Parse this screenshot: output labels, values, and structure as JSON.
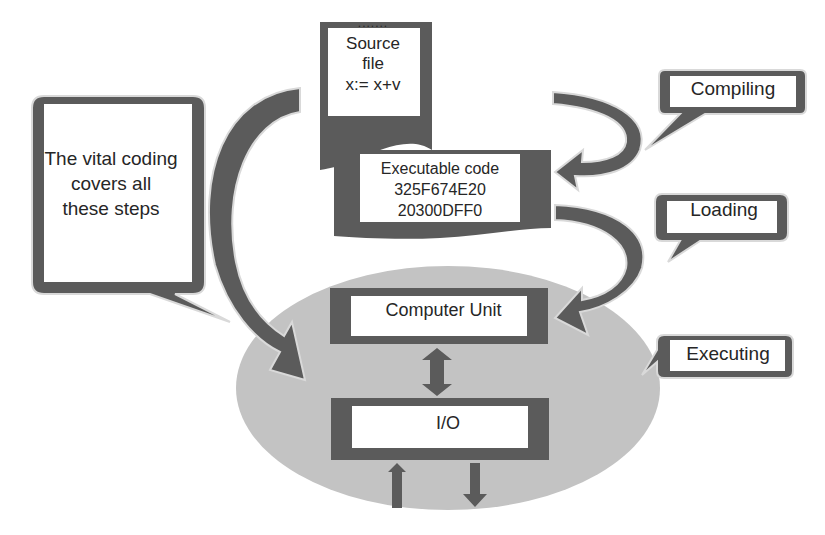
{
  "diagram": {
    "source_file": {
      "dots": ".......",
      "line1": "Source",
      "line2": "file",
      "line3": "x:= x+v"
    },
    "executable_code": {
      "title": "Executable code",
      "line1": "325F674E20",
      "line2": "20300DFF0"
    },
    "computer_unit": "Computer Unit",
    "io": "I/O",
    "callouts": {
      "vital": {
        "line1": "The vital coding",
        "line2": "covers all",
        "line3": "these steps"
      },
      "compiling": "Compiling",
      "loading": "Loading",
      "executing": "Executing"
    },
    "colors": {
      "dark_frame": "#5b5b5b",
      "ellipse_fill": "#c3c3c3",
      "box_fill": "#ffffff",
      "text": "#262626"
    }
  }
}
